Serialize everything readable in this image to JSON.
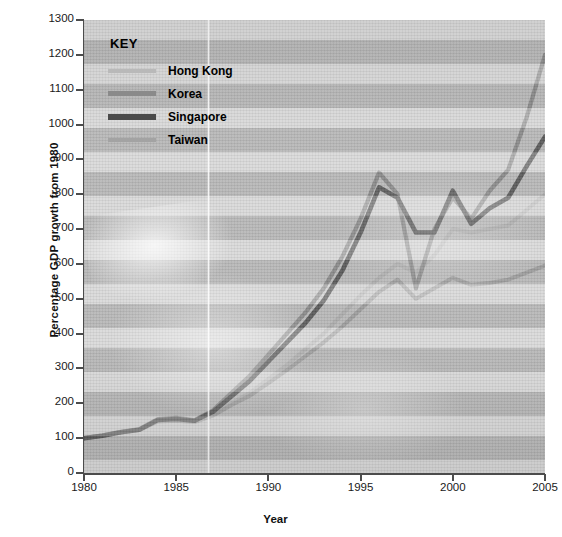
{
  "chart_data": {
    "type": "line",
    "title": "",
    "xlabel": "Year",
    "ylabel": "Percentage GDP growth from 1980",
    "xlim": [
      1980,
      2005
    ],
    "ylim": [
      0,
      1300
    ],
    "ytick_step": 100,
    "grid": false,
    "legend_title": "KEY",
    "legend_position": "top-left inside plot",
    "xticks": [
      "1980",
      "1985",
      "1990",
      "1995",
      "2000",
      "2005"
    ],
    "yticks": [
      "0",
      "100",
      "200",
      "300",
      "400",
      "500",
      "600",
      "700",
      "800",
      "900",
      "1000",
      "1100",
      "1200",
      "1300"
    ],
    "x": [
      1980,
      1981,
      1982,
      1983,
      1984,
      1985,
      1986,
      1987,
      1988,
      1989,
      1990,
      1991,
      1992,
      1993,
      1994,
      1995,
      1996,
      1997,
      1998,
      1999,
      2000,
      2001,
      2002,
      2003,
      2004,
      2005
    ],
    "series": [
      {
        "name": "Hong Kong",
        "color": "#b9b9b9",
        "width": 4.0,
        "values": [
          100,
          108,
          118,
          125,
          150,
          152,
          148,
          168,
          200,
          230,
          270,
          310,
          355,
          400,
          455,
          510,
          560,
          600,
          575,
          625,
          700,
          690,
          700,
          710,
          755,
          800
        ]
      },
      {
        "name": "Korea",
        "color": "#8a8a8a",
        "width": 4.2,
        "values": [
          100,
          108,
          118,
          126,
          155,
          158,
          152,
          180,
          230,
          280,
          340,
          400,
          460,
          530,
          620,
          730,
          862,
          800,
          530,
          700,
          790,
          730,
          810,
          870,
          1020,
          1200
        ]
      },
      {
        "name": "Singapore",
        "color": "#4a4a4a",
        "width": 4.6,
        "values": [
          100,
          107,
          117,
          124,
          152,
          155,
          150,
          176,
          220,
          265,
          320,
          375,
          430,
          495,
          580,
          690,
          820,
          790,
          690,
          690,
          810,
          715,
          760,
          790,
          880,
          965
        ]
      },
      {
        "name": "Taiwan",
        "color": "#a3a3a3",
        "width": 4.0,
        "values": [
          100,
          107,
          116,
          123,
          148,
          150,
          146,
          165,
          195,
          222,
          258,
          295,
          335,
          375,
          420,
          470,
          520,
          555,
          500,
          530,
          560,
          540,
          545,
          555,
          575,
          595
        ]
      }
    ],
    "annotations": []
  },
  "axis": {
    "y_title": "Percentage GDP growth from 1980",
    "x_title": "Year"
  },
  "legend": {
    "title": "KEY",
    "items": [
      {
        "label": "Hong Kong",
        "color": "#b9b9b9"
      },
      {
        "label": "Korea",
        "color": "#8a8a8a"
      },
      {
        "label": "Singapore",
        "color": "#4a4a4a"
      },
      {
        "label": "Taiwan",
        "color": "#a3a3a3"
      }
    ]
  }
}
